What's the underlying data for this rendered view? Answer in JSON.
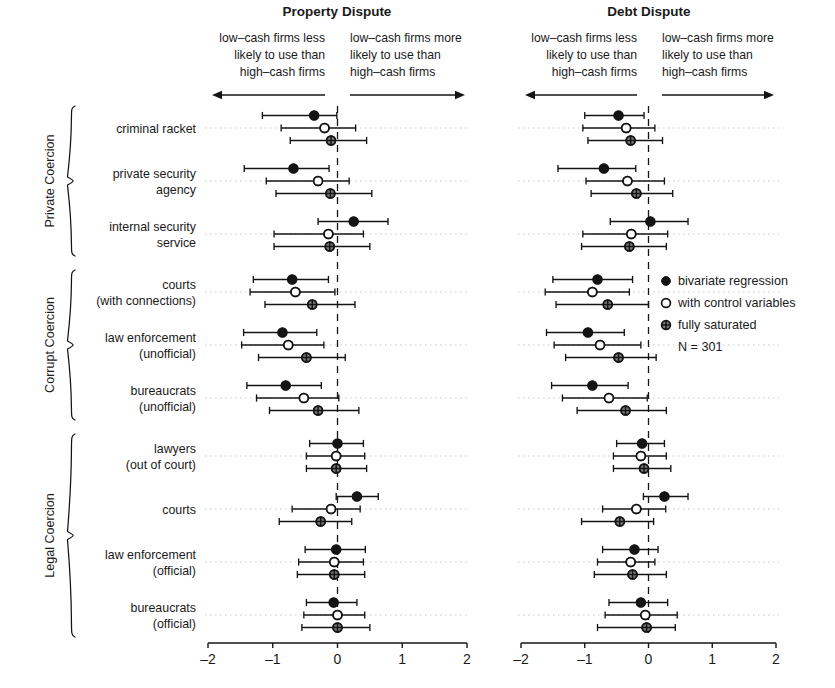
{
  "panels": [
    {
      "key": "property",
      "title": "Property Dispute",
      "left_note": [
        "low–cash firms less",
        "likely to use than",
        "high–cash firms"
      ],
      "right_note": [
        "low–cash firms more",
        "likely to use than",
        "high–cash firms"
      ],
      "axis": {
        "ticks": [
          "-2",
          "-1",
          "0",
          "1",
          "2"
        ],
        "min": -2,
        "max": 2,
        "refline": 0
      }
    },
    {
      "key": "debt",
      "title": "Debt Dispute",
      "left_note": [
        "low–cash firms less",
        "likely to use than",
        "high–cash firms"
      ],
      "right_note": [
        "low–cash firms more",
        "likely to use than",
        "high–cash firms"
      ],
      "axis": {
        "ticks": [
          "-2",
          "-1",
          "0",
          "1",
          "2"
        ],
        "min": -2,
        "max": 2,
        "refline": 0
      }
    }
  ],
  "groups": [
    {
      "label": "Private Coercion",
      "rows": [
        0,
        1,
        2
      ]
    },
    {
      "label": "Corrupt Coercion",
      "rows": [
        3,
        4,
        5
      ]
    },
    {
      "label": "Legal Coercion",
      "rows": [
        6,
        7,
        8,
        9
      ]
    }
  ],
  "row_labels": [
    [
      "criminal racket"
    ],
    [
      "private security",
      "agency"
    ],
    [
      "internal security",
      "service"
    ],
    [
      "courts",
      "(with connections)"
    ],
    [
      "law enforcement",
      "(unofficial)"
    ],
    [
      "bureaucrats",
      "(unofficial)"
    ],
    [
      "lawyers",
      "(out of court)"
    ],
    [
      "courts"
    ],
    [
      "law enforcement",
      "(official)"
    ],
    [
      "bureaucrats",
      "(official)"
    ]
  ],
  "legend": {
    "items": [
      {
        "marker": "filled-circle",
        "label": "bivariate regression"
      },
      {
        "marker": "open-circle",
        "label": "with control variables"
      },
      {
        "marker": "crossed-circle",
        "label": "fully saturated"
      }
    ],
    "n_label": "N = 301"
  },
  "chart_data": {
    "type": "scatter",
    "xlabel": "",
    "ylabel": "",
    "xlim": [
      -2,
      2
    ],
    "grid": "horizontal dotted row guides",
    "legend_position": "right-middle",
    "series": [
      {
        "name": "bivariate regression",
        "marker": "filled-circle"
      },
      {
        "name": "with control variables",
        "marker": "open-circle"
      },
      {
        "name": "fully saturated",
        "marker": "crossed-circle"
      }
    ],
    "note": "Each point is an estimate with a horizontal 95% confidence interval; dashed vertical line marks zero.",
    "panels": {
      "property": [
        {
          "row": "criminal racket",
          "estimates": [
            {
              "series": "bivariate regression",
              "value": -0.36,
              "lo": -1.16,
              "hi": -0.01
            },
            {
              "series": "with control variables",
              "value": -0.2,
              "lo": -0.87,
              "hi": 0.28
            },
            {
              "series": "fully saturated",
              "value": -0.1,
              "lo": -0.73,
              "hi": 0.45
            }
          ]
        },
        {
          "row": "private security agency",
          "estimates": [
            {
              "series": "bivariate regression",
              "value": -0.68,
              "lo": -1.44,
              "hi": -0.13
            },
            {
              "series": "with control variables",
              "value": -0.3,
              "lo": -1.1,
              "hi": 0.18
            },
            {
              "series": "fully saturated",
              "value": -0.11,
              "lo": -0.95,
              "hi": 0.53
            }
          ]
        },
        {
          "row": "internal security service",
          "estimates": [
            {
              "series": "bivariate regression",
              "value": 0.25,
              "lo": -0.3,
              "hi": 0.78
            },
            {
              "series": "with control variables",
              "value": -0.14,
              "lo": -0.98,
              "hi": 0.4
            },
            {
              "series": "fully saturated",
              "value": -0.12,
              "lo": -0.98,
              "hi": 0.5
            }
          ]
        },
        {
          "row": "courts (with connections)",
          "estimates": [
            {
              "series": "bivariate regression",
              "value": -0.7,
              "lo": -1.3,
              "hi": -0.14
            },
            {
              "series": "with control variables",
              "value": -0.65,
              "lo": -1.35,
              "hi": -0.04
            },
            {
              "series": "fully saturated",
              "value": -0.39,
              "lo": -1.12,
              "hi": 0.27
            }
          ]
        },
        {
          "row": "law enforcement (unofficial)",
          "estimates": [
            {
              "series": "bivariate regression",
              "value": -0.85,
              "lo": -1.45,
              "hi": -0.32
            },
            {
              "series": "with control variables",
              "value": -0.76,
              "lo": -1.48,
              "hi": -0.21
            },
            {
              "series": "fully saturated",
              "value": -0.48,
              "lo": -1.22,
              "hi": 0.12
            }
          ]
        },
        {
          "row": "bureaucrats (unofficial)",
          "estimates": [
            {
              "series": "bivariate regression",
              "value": -0.8,
              "lo": -1.4,
              "hi": -0.25
            },
            {
              "series": "with control variables",
              "value": -0.52,
              "lo": -1.25,
              "hi": 0.02
            },
            {
              "series": "fully saturated",
              "value": -0.3,
              "lo": -1.05,
              "hi": 0.33
            }
          ]
        },
        {
          "row": "lawyers (out of court)",
          "estimates": [
            {
              "series": "bivariate regression",
              "value": 0.0,
              "lo": -0.43,
              "hi": 0.4
            },
            {
              "series": "with control variables",
              "value": -0.02,
              "lo": -0.48,
              "hi": 0.42
            },
            {
              "series": "fully saturated",
              "value": -0.02,
              "lo": -0.48,
              "hi": 0.45
            }
          ]
        },
        {
          "row": "courts",
          "estimates": [
            {
              "series": "bivariate regression",
              "value": 0.3,
              "lo": -0.02,
              "hi": 0.63
            },
            {
              "series": "with control variables",
              "value": -0.1,
              "lo": -0.7,
              "hi": 0.35
            },
            {
              "series": "fully saturated",
              "value": -0.26,
              "lo": -0.9,
              "hi": 0.22
            }
          ]
        },
        {
          "row": "law enforcement (official)",
          "estimates": [
            {
              "series": "bivariate regression",
              "value": -0.02,
              "lo": -0.5,
              "hi": 0.43
            },
            {
              "series": "with control variables",
              "value": -0.05,
              "lo": -0.6,
              "hi": 0.4
            },
            {
              "series": "fully saturated",
              "value": -0.05,
              "lo": -0.62,
              "hi": 0.42
            }
          ]
        },
        {
          "row": "bureaucrats (official)",
          "estimates": [
            {
              "series": "bivariate regression",
              "value": -0.06,
              "lo": -0.48,
              "hi": 0.3
            },
            {
              "series": "with control variables",
              "value": 0.0,
              "lo": -0.52,
              "hi": 0.42
            },
            {
              "series": "fully saturated",
              "value": 0.0,
              "lo": -0.55,
              "hi": 0.5
            }
          ]
        }
      ],
      "debt": [
        {
          "row": "criminal racket",
          "estimates": [
            {
              "series": "bivariate regression",
              "value": -0.47,
              "lo": -1.0,
              "hi": -0.07
            },
            {
              "series": "with control variables",
              "value": -0.35,
              "lo": -1.03,
              "hi": 0.1
            },
            {
              "series": "fully saturated",
              "value": -0.28,
              "lo": -0.95,
              "hi": 0.22
            }
          ]
        },
        {
          "row": "private security agency",
          "estimates": [
            {
              "series": "bivariate regression",
              "value": -0.7,
              "lo": -1.42,
              "hi": -0.2
            },
            {
              "series": "with control variables",
              "value": -0.33,
              "lo": -0.98,
              "hi": 0.25
            },
            {
              "series": "fully saturated",
              "value": -0.19,
              "lo": -0.9,
              "hi": 0.38
            }
          ]
        },
        {
          "row": "internal security service",
          "estimates": [
            {
              "series": "bivariate regression",
              "value": 0.03,
              "lo": -0.6,
              "hi": 0.62
            },
            {
              "series": "with control variables",
              "value": -0.27,
              "lo": -1.03,
              "hi": 0.3
            },
            {
              "series": "fully saturated",
              "value": -0.3,
              "lo": -1.05,
              "hi": 0.28
            }
          ]
        },
        {
          "row": "courts (with connections)",
          "estimates": [
            {
              "series": "bivariate regression",
              "value": -0.8,
              "lo": -1.5,
              "hi": -0.25
            },
            {
              "series": "with control variables",
              "value": -0.88,
              "lo": -1.62,
              "hi": -0.3
            },
            {
              "series": "fully saturated",
              "value": -0.64,
              "lo": -1.45,
              "hi": 0.0
            }
          ]
        },
        {
          "row": "law enforcement (unofficial)",
          "estimates": [
            {
              "series": "bivariate regression",
              "value": -0.95,
              "lo": -1.6,
              "hi": -0.38
            },
            {
              "series": "with control variables",
              "value": -0.76,
              "lo": -1.48,
              "hi": -0.12
            },
            {
              "series": "fully saturated",
              "value": -0.47,
              "lo": -1.3,
              "hi": 0.12
            }
          ]
        },
        {
          "row": "bureaucrats (unofficial)",
          "estimates": [
            {
              "series": "bivariate regression",
              "value": -0.88,
              "lo": -1.52,
              "hi": -0.32
            },
            {
              "series": "with control variables",
              "value": -0.62,
              "lo": -1.35,
              "hi": -0.02
            },
            {
              "series": "fully saturated",
              "value": -0.36,
              "lo": -1.12,
              "hi": 0.28
            }
          ]
        },
        {
          "row": "lawyers (out of court)",
          "estimates": [
            {
              "series": "bivariate regression",
              "value": -0.1,
              "lo": -0.5,
              "hi": 0.25
            },
            {
              "series": "with control variables",
              "value": -0.12,
              "lo": -0.55,
              "hi": 0.28
            },
            {
              "series": "fully saturated",
              "value": -0.07,
              "lo": -0.55,
              "hi": 0.35
            }
          ]
        },
        {
          "row": "courts",
          "estimates": [
            {
              "series": "bivariate regression",
              "value": 0.25,
              "lo": -0.08,
              "hi": 0.62
            },
            {
              "series": "with control variables",
              "value": -0.19,
              "lo": -0.72,
              "hi": 0.27
            },
            {
              "series": "fully saturated",
              "value": -0.45,
              "lo": -1.05,
              "hi": 0.08
            }
          ]
        },
        {
          "row": "law enforcement (official)",
          "estimates": [
            {
              "series": "bivariate regression",
              "value": -0.22,
              "lo": -0.72,
              "hi": 0.15
            },
            {
              "series": "with control variables",
              "value": -0.28,
              "lo": -0.8,
              "hi": 0.1
            },
            {
              "series": "fully saturated",
              "value": -0.25,
              "lo": -0.85,
              "hi": 0.28
            }
          ]
        },
        {
          "row": "bureaucrats (official)",
          "estimates": [
            {
              "series": "bivariate regression",
              "value": -0.12,
              "lo": -0.62,
              "hi": 0.3
            },
            {
              "series": "with control variables",
              "value": -0.05,
              "lo": -0.68,
              "hi": 0.45
            },
            {
              "series": "fully saturated",
              "value": -0.03,
              "lo": -0.8,
              "hi": 0.42
            }
          ]
        }
      ]
    }
  }
}
